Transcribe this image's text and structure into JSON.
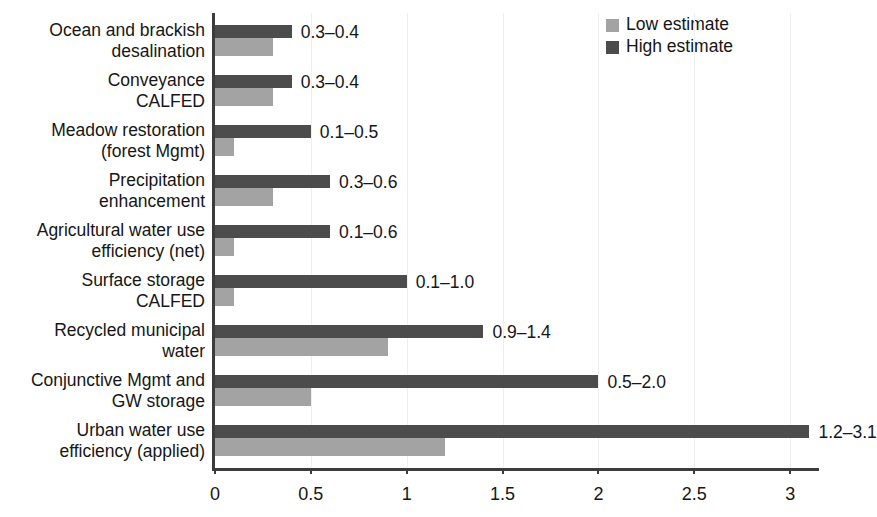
{
  "chart_data": {
    "type": "bar",
    "orientation": "horizontal",
    "title": "",
    "xlabel": "",
    "ylabel": "",
    "xlim": [
      0,
      3.15
    ],
    "xticks": [
      0,
      0.5,
      1,
      1.5,
      2,
      2.5,
      3
    ],
    "xtick_labels": [
      "0",
      "0.5",
      "1",
      "1.5",
      "2",
      "2.5",
      "3"
    ],
    "grid": true,
    "grid_axis": "x",
    "legend_position": "top-right",
    "categories": [
      "Ocean and brackish desalination",
      "Conveyance CALFED",
      "Meadow restoration (forest Mgmt)",
      "Precipitation enhancement",
      "Agricultural water use efficiency (net)",
      "Surface storage CALFED",
      "Recycled municipal water",
      "Conjunctive Mgmt and GW storage",
      "Urban water use efficiency (applied)"
    ],
    "category_lines": [
      [
        "Ocean and brackish",
        "desalination"
      ],
      [
        "Conveyance",
        "CALFED"
      ],
      [
        "Meadow restoration",
        "(forest Mgmt)"
      ],
      [
        "Precipitation",
        "enhancement"
      ],
      [
        "Agricultural water use",
        "efficiency (net)"
      ],
      [
        "Surface storage",
        "CALFED"
      ],
      [
        "Recycled municipal",
        "water"
      ],
      [
        "Conjunctive Mgmt and",
        "GW storage"
      ],
      [
        "Urban water use",
        "efficiency (applied)"
      ]
    ],
    "series": [
      {
        "name": "Low estimate",
        "color": "#a3a3a3",
        "values": [
          0.3,
          0.3,
          0.1,
          0.3,
          0.1,
          0.1,
          0.9,
          0.5,
          1.2
        ]
      },
      {
        "name": "High estimate",
        "color": "#4c4c4c",
        "values": [
          0.4,
          0.4,
          0.5,
          0.6,
          0.6,
          1.0,
          1.4,
          2.0,
          3.1
        ]
      }
    ],
    "data_labels": [
      "0.3–0.4",
      "0.3–0.4",
      "0.1–0.5",
      "0.3–0.6",
      "0.1–0.6",
      "0.1–1.0",
      "0.9–1.4",
      "0.5–2.0",
      "1.2–3.1"
    ]
  },
  "legend": {
    "items": [
      {
        "label": "Low estimate",
        "color": "#a3a3a3"
      },
      {
        "label": "High estimate",
        "color": "#4c4c4c"
      }
    ]
  },
  "colors": {
    "low_estimate": "#a3a3a3",
    "high_estimate": "#4c4c4c",
    "axis": "#3c3c3c",
    "gridline": "#efefef",
    "text": "#161616",
    "background": "#ffffff"
  }
}
